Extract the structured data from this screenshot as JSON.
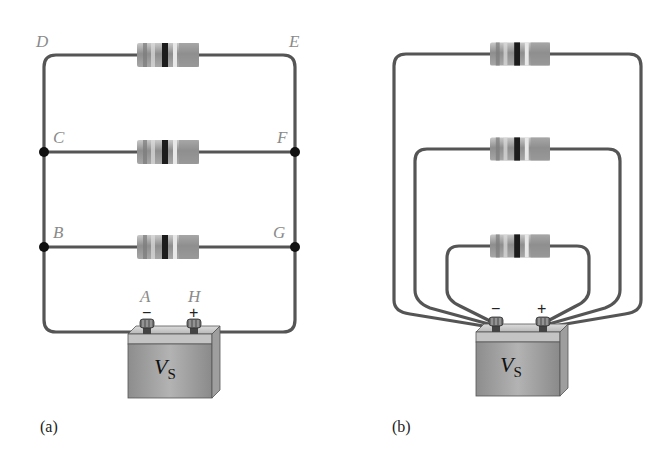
{
  "figure": {
    "panel_a": {
      "caption": "(a)",
      "node_labels": {
        "D": "D",
        "E": "E",
        "C": "C",
        "F": "F",
        "B": "B",
        "G": "G",
        "A": "A",
        "H": "H"
      },
      "battery": {
        "label": "V",
        "subscript": "S",
        "minus": "−",
        "plus": "+"
      },
      "resistor_count": 3
    },
    "panel_b": {
      "caption": "(b)",
      "battery": {
        "label": "V",
        "subscript": "S",
        "minus": "−",
        "plus": "+"
      },
      "resistor_count": 3
    },
    "colors": {
      "wire": "#555555",
      "label_gray": "#8a8a8a",
      "battery_body": "#9a9a9a"
    }
  }
}
